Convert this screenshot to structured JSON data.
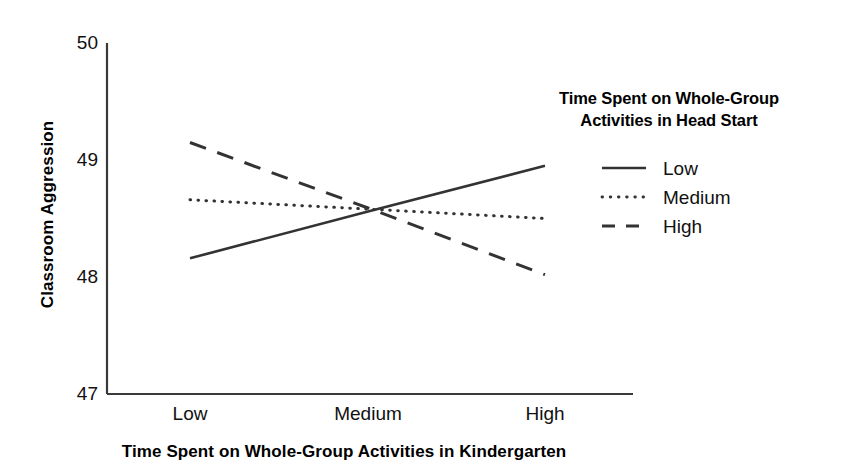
{
  "chart_data": {
    "type": "line",
    "title": "",
    "xlabel": "Time Spent on Whole-Group Activities in Kindergarten",
    "ylabel": "Classroom Aggression",
    "categories": [
      "Low",
      "Medium",
      "High"
    ],
    "x_tick_labels": [
      "Low",
      "Medium",
      "High"
    ],
    "y_tick_labels": [
      "47",
      "48",
      "49",
      "50"
    ],
    "ylim": [
      47,
      50
    ],
    "yticks": [
      47,
      48,
      49,
      50
    ],
    "grid": false,
    "legend_position": "upper right",
    "legend_title": "Time Spent on Whole-Group Activities in Head Start",
    "series": [
      {
        "name": "Low",
        "style": "solid",
        "color": "#333333",
        "values": [
          48.16,
          48.56,
          48.95
        ]
      },
      {
        "name": "Medium",
        "style": "dotted",
        "color": "#333333",
        "values": [
          48.66,
          48.58,
          48.5
        ]
      },
      {
        "name": "High",
        "style": "dashed",
        "color": "#333333",
        "values": [
          49.15,
          48.59,
          48.02
        ]
      }
    ],
    "annotations": []
  },
  "axis": {
    "y_label": "Classroom Aggression",
    "x_label": "Time Spent on Whole-Group Activities in Kindergarten",
    "y_ticks": [
      "50",
      "49",
      "48",
      "47"
    ],
    "x_ticks": [
      "Low",
      "Medium",
      "High"
    ]
  },
  "legend": {
    "title_line1": "Time Spent on Whole-Group",
    "title_line2": "Activities in Head Start",
    "items": [
      {
        "label": "Low",
        "style": "solid"
      },
      {
        "label": "Medium",
        "style": "dotted"
      },
      {
        "label": "High",
        "style": "dashed"
      }
    ]
  },
  "colors": {
    "ink": "#333333",
    "background": "#ffffff"
  }
}
